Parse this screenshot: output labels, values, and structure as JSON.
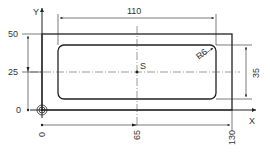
{
  "drawing": {
    "axis_x_label": "X",
    "axis_y_label": "Y",
    "center_label": "S",
    "y_ticks": [
      "50",
      "25",
      "0"
    ],
    "x_ticks": [
      "0",
      "65",
      "130"
    ],
    "dim_width": "110",
    "dim_height": "35",
    "radius_label": "R6",
    "colors": {
      "line": "#222222",
      "background": "#ffffff"
    }
  }
}
